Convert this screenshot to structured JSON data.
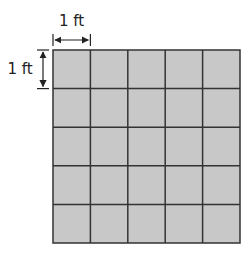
{
  "diagram": {
    "rows": 5,
    "cols": 5,
    "cell_fill": "#c8c8c8",
    "line_color": "#333333",
    "labels": {
      "horizontal": "1 ft",
      "vertical": "1 ft"
    }
  }
}
